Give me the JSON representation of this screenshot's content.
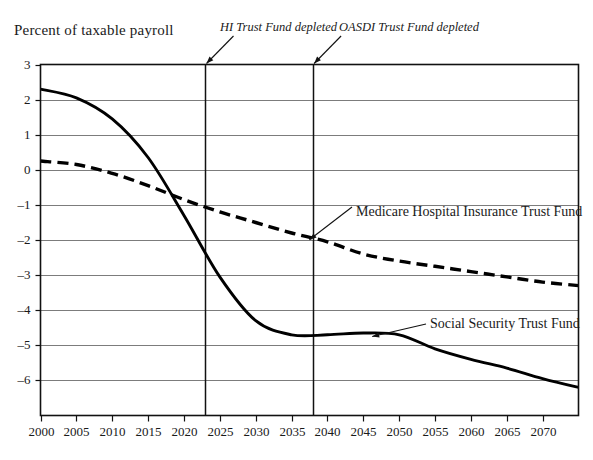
{
  "chart_data": {
    "type": "line",
    "title": "",
    "ylabel": "Percent of taxable payroll",
    "xlabel": "",
    "xlim": [
      2000,
      2075
    ],
    "ylim": [
      -6.5,
      3
    ],
    "grid": true,
    "legend_position": "inline-annotations",
    "x_ticks": [
      2000,
      2005,
      2010,
      2015,
      2020,
      2025,
      2030,
      2035,
      2040,
      2045,
      2050,
      2055,
      2060,
      2065,
      2070
    ],
    "y_ticks": [
      3,
      2,
      1,
      0,
      -1,
      -2,
      -3,
      -4,
      -5,
      -6
    ],
    "y_tick_labels": [
      "3",
      "2",
      "1",
      "0",
      "–1",
      "–2",
      "–3",
      "–4",
      "–5",
      "–6"
    ],
    "series": [
      {
        "name": "Social Security Trust Fund",
        "style": "solid",
        "color": "#000000",
        "x": [
          2000,
          2005,
          2010,
          2015,
          2020,
          2025,
          2030,
          2035,
          2040,
          2045,
          2050,
          2055,
          2060,
          2065,
          2070,
          2075
        ],
        "values": [
          2.3,
          2.05,
          1.45,
          0.35,
          -1.3,
          -3.05,
          -4.3,
          -4.7,
          -4.7,
          -4.65,
          -4.7,
          -5.1,
          -5.4,
          -5.65,
          -5.95,
          -6.2
        ]
      },
      {
        "name": "Medicare Hospital Insurance Trust Fund",
        "style": "dashed",
        "color": "#000000",
        "x": [
          2000,
          2005,
          2010,
          2015,
          2020,
          2025,
          2030,
          2035,
          2040,
          2045,
          2050,
          2055,
          2060,
          2065,
          2070,
          2075
        ],
        "values": [
          0.25,
          0.15,
          -0.1,
          -0.45,
          -0.85,
          -1.2,
          -1.5,
          -1.8,
          -2.05,
          -2.4,
          -2.6,
          -2.75,
          -2.9,
          -3.05,
          -3.2,
          -3.3
        ]
      }
    ],
    "annotations": [
      {
        "name": "hi-depleted",
        "label": "HI Trust Fund depleted",
        "x": 2023,
        "type": "vline-with-arrow"
      },
      {
        "name": "oasdi-depleted",
        "label": "OASDI Trust Fund depleted",
        "x": 2038,
        "type": "vline-with-arrow"
      },
      {
        "name": "medicare-callout",
        "label": "Medicare Hospital Insurance Trust Fund",
        "points_to_x": 2040,
        "points_to_y": -2.05
      },
      {
        "name": "socsec-callout",
        "label": "Social Security Trust Fund",
        "points_to_x": 2050,
        "points_to_y": -4.72
      }
    ]
  }
}
